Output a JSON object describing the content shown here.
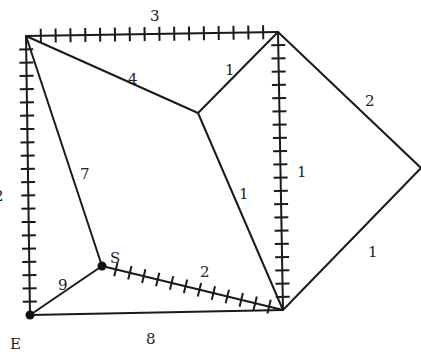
{
  "diagram": {
    "type": "weighted-graph",
    "vertices": [
      {
        "id": "A",
        "x": 26,
        "y": 36,
        "label": "",
        "marked": false
      },
      {
        "id": "B",
        "x": 278,
        "y": 32,
        "label": "",
        "marked": false
      },
      {
        "id": "C",
        "x": 198,
        "y": 113,
        "label": "",
        "marked": false
      },
      {
        "id": "D",
        "x": 421,
        "y": 168,
        "label": "",
        "marked": false
      },
      {
        "id": "F",
        "x": 283,
        "y": 310,
        "label": "",
        "marked": false
      },
      {
        "id": "S",
        "x": 102,
        "y": 266,
        "label": "S",
        "marked": true,
        "lx": 110,
        "ly": 252
      },
      {
        "id": "E",
        "x": 30,
        "y": 315,
        "label": "E",
        "marked": true,
        "lx": 10,
        "ly": 338
      }
    ],
    "edges": [
      {
        "from": "A",
        "to": "B",
        "weight": "3",
        "lx": 150,
        "ly": 10,
        "hatched": true,
        "ticks": 16,
        "side": -1
      },
      {
        "from": "A",
        "to": "C",
        "weight": "4",
        "lx": 128,
        "ly": 73,
        "hatched": false
      },
      {
        "from": "C",
        "to": "B",
        "weight": "1",
        "lx": 225,
        "ly": 64,
        "hatched": false
      },
      {
        "from": "B",
        "to": "D",
        "weight": "2",
        "lx": 365,
        "ly": 95,
        "hatched": false
      },
      {
        "from": "B",
        "to": "F",
        "weight": "1",
        "lx": 297,
        "ly": 166,
        "hatched": true,
        "ticks": 20,
        "side": 0
      },
      {
        "from": "C",
        "to": "F",
        "weight": "1",
        "lx": 239,
        "ly": 188,
        "hatched": false
      },
      {
        "from": "D",
        "to": "F",
        "weight": "1",
        "lx": 368,
        "ly": 246,
        "hatched": false
      },
      {
        "from": "A",
        "to": "S",
        "weight": "7",
        "lx": 80,
        "ly": 168,
        "hatched": false
      },
      {
        "from": "A",
        "to": "E",
        "weight": "2",
        "lx": -6,
        "ly": 190,
        "hatched": true,
        "ticks": 20,
        "side": 0
      },
      {
        "from": "S",
        "to": "F",
        "weight": "2",
        "lx": 200,
        "ly": 266,
        "hatched": true,
        "ticks": 12,
        "side": 0
      },
      {
        "from": "E",
        "to": "S",
        "weight": "9",
        "lx": 58,
        "ly": 279,
        "hatched": false
      },
      {
        "from": "E",
        "to": "F",
        "weight": "8",
        "lx": 146,
        "ly": 333,
        "hatched": false
      }
    ],
    "colors": {
      "line": "#1a1a1a",
      "node": "#111111",
      "text": "#222222",
      "background": "#ffffff"
    }
  }
}
